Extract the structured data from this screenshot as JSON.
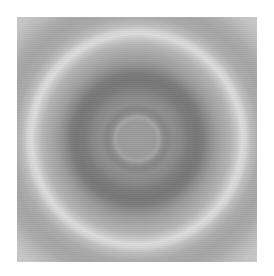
{
  "image": {
    "description": "Grayscale concentric ring pattern",
    "colors": {
      "center_disk": "#9a9a9a",
      "dark_band": "#777777",
      "bright_ring": "#d9d9d9",
      "outer_band": "#a4a4a4",
      "corner": "#c8c8c8"
    }
  }
}
